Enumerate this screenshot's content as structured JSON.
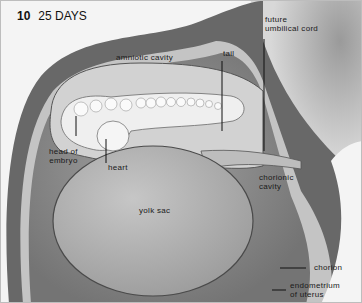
{
  "figure": {
    "number": "10",
    "title": "25 DAYS"
  },
  "labels": {
    "amniotic_cavity": "amniotic cavity",
    "tail": "tail",
    "future_umbilical_cord_line1": "future",
    "future_umbilical_cord_line2": "umbilical cord",
    "head_of_embryo_line1": "head of",
    "head_of_embryo_line2": "embryo",
    "heart": "heart",
    "chorionic_cavity_line1": "chorionic",
    "chorionic_cavity_line2": "cavity",
    "yolk_sac": "yolk sac",
    "chorion": "chorion",
    "endometrium_line1": "endometrium",
    "endometrium_line2": "of uterus"
  },
  "colors": {
    "uterus_wall": "#6e6e6e",
    "chorion_band": "#c9c9c9",
    "chorionic_cavity": "#8a8a8a",
    "yolk_sac": "#b4b4b4",
    "amnion": "#d6d6d6",
    "embryo": "#eeeeee",
    "background": "#f4f4f4"
  }
}
